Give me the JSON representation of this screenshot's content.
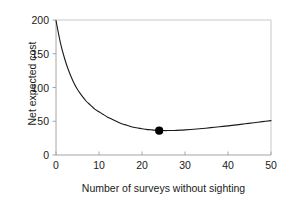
{
  "chart_data": {
    "type": "line",
    "title": "",
    "xlabel": "Number of surveys without sighting",
    "ylabel": "Net expected cost",
    "xlim": [
      0,
      50
    ],
    "ylim": [
      0,
      200
    ],
    "xticks": [
      0,
      10,
      20,
      30,
      40,
      50
    ],
    "yticks": [
      0,
      50,
      100,
      150,
      200
    ],
    "xtick_labels": [
      "0",
      "10",
      "20",
      "30",
      "40",
      "50"
    ],
    "ytick_labels": [
      "0",
      "50",
      "100",
      "150",
      "200"
    ],
    "grid": false,
    "legend": false,
    "legend_position": "none",
    "line_color": "#1a1a1a",
    "marker_color": "#000000",
    "frame_color": "#bfbfbf",
    "series": [
      {
        "name": "Net expected cost",
        "x": [
          0,
          1,
          2,
          3,
          4,
          5,
          6,
          7,
          8,
          9,
          10,
          11,
          12,
          13,
          14,
          15,
          16,
          17,
          18,
          19,
          20,
          21,
          22,
          23,
          24,
          25,
          26,
          27,
          28,
          29,
          30,
          32,
          34,
          36,
          38,
          40,
          42,
          44,
          46,
          48,
          50
        ],
        "y": [
          199,
          167,
          143,
          124,
          109,
          97,
          88,
          80,
          74,
          68,
          64,
          60,
          56,
          53,
          50,
          47,
          45,
          43,
          41,
          40,
          39,
          38,
          37.4,
          36.8,
          36.4,
          36.2,
          36.2,
          36.3,
          36.5,
          36.8,
          37.2,
          38.1,
          39.2,
          40.5,
          41.8,
          43.2,
          44.7,
          46.2,
          47.8,
          49.4,
          51.0
        ]
      }
    ],
    "highlight_point": {
      "label": "optimum",
      "x": 24,
      "y": 36
    }
  }
}
